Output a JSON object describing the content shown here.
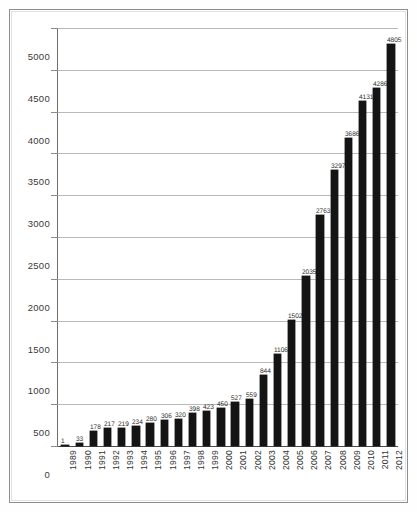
{
  "chart_data": {
    "type": "bar",
    "title": "",
    "subtitle": "",
    "xlabel": "",
    "ylabel": "",
    "categories": [
      "1989",
      "1990",
      "1991",
      "1992",
      "1993",
      "1994",
      "1995",
      "1996",
      "1997",
      "1998",
      "1999",
      "2000",
      "2001",
      "2002",
      "2003",
      "2004",
      "2005",
      "2006",
      "2007",
      "2008",
      "2009",
      "2010",
      "2011",
      "2012"
    ],
    "values": [
      1,
      33,
      178,
      217,
      219,
      234,
      280,
      306,
      320,
      398,
      423,
      450,
      527,
      559,
      844,
      1106,
      1502,
      2035,
      2763,
      3297,
      3686,
      4131,
      4286,
      4805
    ],
    "ylim": [
      0,
      5000
    ],
    "yticks": [
      0,
      500,
      1000,
      1500,
      2000,
      2500,
      3000,
      3500,
      4000,
      4500,
      5000
    ],
    "ytick_labels": [
      "0",
      "500",
      "1000",
      "1500",
      "2000",
      "2500",
      "3000",
      "3500",
      "4000",
      "4500",
      "5000"
    ],
    "grid": "horizontal",
    "legend": "none",
    "bar_color": "#141414",
    "grid_color": "#b9b9b9",
    "axis_color": "#4a4a4a",
    "label_color": "#2e2e2e",
    "data_labels_shown": true
  }
}
